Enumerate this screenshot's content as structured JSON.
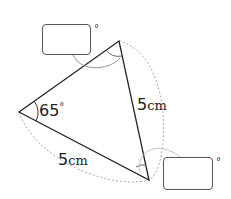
{
  "figure": {
    "type": "triangle",
    "given_angle": {
      "value": "65",
      "symbol": "°"
    },
    "side_right": {
      "value": "5",
      "unit": "cm"
    },
    "side_bottom": {
      "value": "5",
      "unit": "cm"
    },
    "unknown_angle_top": {
      "symbol": "°",
      "placeholder": ""
    },
    "unknown_angle_bottom": {
      "symbol": "°",
      "placeholder": ""
    },
    "colors": {
      "stroke": "#222222",
      "dashed": "#aaaaaa",
      "box_border": "#555555"
    }
  }
}
